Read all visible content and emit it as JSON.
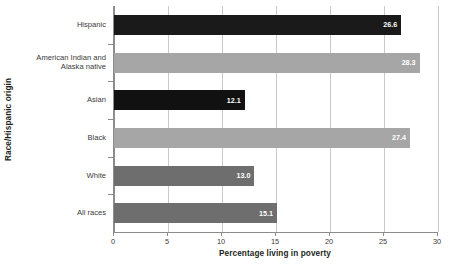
{
  "chart_data": {
    "type": "bar",
    "orientation": "horizontal",
    "title": "",
    "xlabel": "Percentage living in poverty",
    "ylabel": "Race/Hispanic origin",
    "xlim": [
      0,
      30
    ],
    "xticks": [
      "0",
      "5",
      "10",
      "15",
      "20",
      "25",
      "30"
    ],
    "xtick_values": [
      0,
      5,
      10,
      15,
      20,
      25,
      30
    ],
    "grid": "vertical",
    "legend": "none",
    "categories": [
      "Hispanic",
      "American Indian and Alaska native",
      "Asian",
      "Black",
      "White",
      "All races"
    ],
    "values": [
      26.6,
      28.3,
      12.1,
      27.4,
      13.0,
      15.1
    ],
    "value_labels": [
      "26.6",
      "28.3",
      "12.1",
      "27.4",
      "13.0",
      "15.1"
    ],
    "bars": [
      {
        "category": "Hispanic",
        "category_line1": "Hispanic",
        "category_line2": "",
        "value": 26.6,
        "label": "26.6",
        "color": "#1a1a1a",
        "shade": "black"
      },
      {
        "category": "American Indian and Alaska native",
        "category_line1": "American Indian and",
        "category_line2": "Alaska native",
        "value": 28.3,
        "label": "28.3",
        "color": "#a6a6a6",
        "shade": "light"
      },
      {
        "category": "Asian",
        "category_line1": "Asian",
        "category_line2": "",
        "value": 12.1,
        "label": "12.1",
        "color": "#111111",
        "shade": "black"
      },
      {
        "category": "Black",
        "category_line1": "Black",
        "category_line2": "",
        "value": 27.4,
        "label": "27.4",
        "color": "#a6a6a6",
        "shade": "light"
      },
      {
        "category": "White",
        "category_line1": "White",
        "category_line2": "",
        "value": 13.0,
        "label": "13.0",
        "color": "#6e6e6e",
        "shade": "dark"
      },
      {
        "category": "All races",
        "category_line1": "All races",
        "category_line2": "",
        "value": 15.1,
        "label": "15.1",
        "color": "#6e6e6e",
        "shade": "dark"
      }
    ],
    "colors": {
      "black_bar": "#1a1a1a",
      "light_gray_bar": "#a6a6a6",
      "dark_gray_bar": "#6e6e6e",
      "gridline": "#c9c9c9",
      "axis": "#8c8c8c",
      "text": "#231f20",
      "background": "#ffffff"
    }
  }
}
